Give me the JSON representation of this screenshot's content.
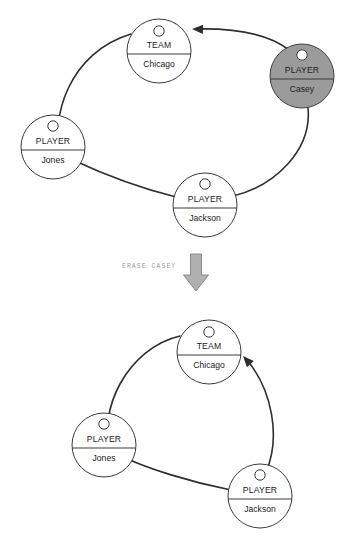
{
  "canvas": {
    "width": 352,
    "height": 552,
    "background": "#ffffff"
  },
  "colors": {
    "stroke": "#2e2e2e",
    "node_fill": "#ffffff",
    "node_shaded_fill": "#9b9b9b",
    "text": "#222222",
    "label_text": "#9a9a9a",
    "block_arrow_fill": "#b0b0b0",
    "block_arrow_stroke": "#8a8a8a"
  },
  "transition": {
    "label": "ERASE CASEY",
    "icon": "down-block-arrow-icon",
    "label_x": 122,
    "label_y": 266,
    "arrow_x": 196,
    "arrow_y": 254
  },
  "diagrams": [
    {
      "id": "before",
      "name": "graph-before-erase",
      "nodes": [
        {
          "id": "team-chicago-before",
          "name": "node-team-chicago",
          "type": "TEAM",
          "value": "Chicago",
          "cx": 159,
          "cy": 51,
          "r": 32,
          "shaded": false,
          "glyph": "node-handle-circle-icon",
          "glyph_cx": 159,
          "glyph_cy": 31,
          "glyph_r": 5.2,
          "type_y": 48,
          "divider_y": 54,
          "value_y": 67
        },
        {
          "id": "player-casey-before",
          "name": "node-player-casey",
          "type": "PLAYER",
          "value": "Casey",
          "cx": 302,
          "cy": 76,
          "r": 32,
          "shaded": true,
          "glyph": "node-handle-circle-icon",
          "glyph_cx": 302,
          "glyph_cy": 55,
          "glyph_r": 5.2,
          "type_y": 73,
          "divider_y": 79,
          "value_y": 92
        },
        {
          "id": "player-jones-before",
          "name": "node-player-jones",
          "type": "PLAYER",
          "value": "Jones",
          "cx": 53,
          "cy": 147,
          "r": 32,
          "shaded": false,
          "glyph": "node-handle-circle-icon",
          "glyph_cx": 53,
          "glyph_cy": 126,
          "glyph_r": 5.2,
          "type_y": 144,
          "divider_y": 150,
          "value_y": 163
        },
        {
          "id": "player-jackson-before",
          "name": "node-player-jackson",
          "type": "PLAYER",
          "value": "Jackson",
          "cx": 205,
          "cy": 205,
          "r": 32,
          "shaded": false,
          "glyph": "node-handle-circle-icon",
          "glyph_cx": 205,
          "glyph_cy": 184,
          "glyph_r": 5.2,
          "type_y": 202,
          "divider_y": 208,
          "value_y": 221
        }
      ],
      "edges": [
        {
          "name": "edge-casey-to-team",
          "from": "player-casey-before",
          "to": "team-chicago-before",
          "path": "M 289,50 C 270,35 240,28 196,29",
          "arrow": {
            "x": 192,
            "y": 29,
            "angle": 182
          }
        },
        {
          "name": "edge-casey-to-jackson",
          "from": "player-casey-before",
          "to": "player-jackson-before",
          "path": "M 308,108 C 312,150 275,186 233,196"
        },
        {
          "name": "edge-jackson-to-jones",
          "from": "player-jackson-before",
          "to": "player-jones-before",
          "path": "M 176,197 C 140,188 105,175 73,160"
        },
        {
          "name": "edge-jones-to-team",
          "from": "player-jones-before",
          "to": "team-chicago-before",
          "path": "M 62,160 C 48,118 70,52 131,34"
        }
      ]
    },
    {
      "id": "after",
      "name": "graph-after-erase",
      "nodes": [
        {
          "id": "team-chicago-after",
          "name": "node-team-chicago",
          "type": "TEAM",
          "value": "Chicago",
          "cx": 209,
          "cy": 352,
          "r": 32,
          "shaded": false,
          "glyph": "node-handle-circle-icon",
          "glyph_cx": 209,
          "glyph_cy": 332,
          "glyph_r": 5.2,
          "type_y": 349,
          "divider_y": 355,
          "value_y": 368
        },
        {
          "id": "player-jones-after",
          "name": "node-player-jones",
          "type": "PLAYER",
          "value": "Jones",
          "cx": 104,
          "cy": 445,
          "r": 32,
          "shaded": false,
          "glyph": "node-handle-circle-icon",
          "glyph_cx": 104,
          "glyph_cy": 424,
          "glyph_r": 5.2,
          "type_y": 442,
          "divider_y": 448,
          "value_y": 461
        },
        {
          "id": "player-jackson-after",
          "name": "node-player-jackson",
          "type": "PLAYER",
          "value": "Jackson",
          "cx": 260,
          "cy": 496,
          "r": 32,
          "shaded": false,
          "glyph": "node-handle-circle-icon",
          "glyph_cx": 260,
          "glyph_cy": 475,
          "glyph_r": 5.2,
          "type_y": 493,
          "divider_y": 499,
          "value_y": 512
        }
      ],
      "edges": [
        {
          "name": "edge-jackson-to-team",
          "from": "player-jackson-after",
          "to": "team-chicago-after",
          "path": "M 266,472 C 281,437 272,390 247,360",
          "arrow": {
            "x": 243,
            "y": 356,
            "angle": 228
          }
        },
        {
          "name": "edge-jackson-to-jones",
          "from": "player-jackson-after",
          "to": "player-jones-after",
          "path": "M 231,490 C 190,482 145,468 119,455"
        },
        {
          "name": "edge-jones-to-team",
          "from": "player-jones-after",
          "to": "team-chicago-after",
          "path": "M 111,456 C 96,410 128,348 180,336"
        }
      ]
    }
  ]
}
